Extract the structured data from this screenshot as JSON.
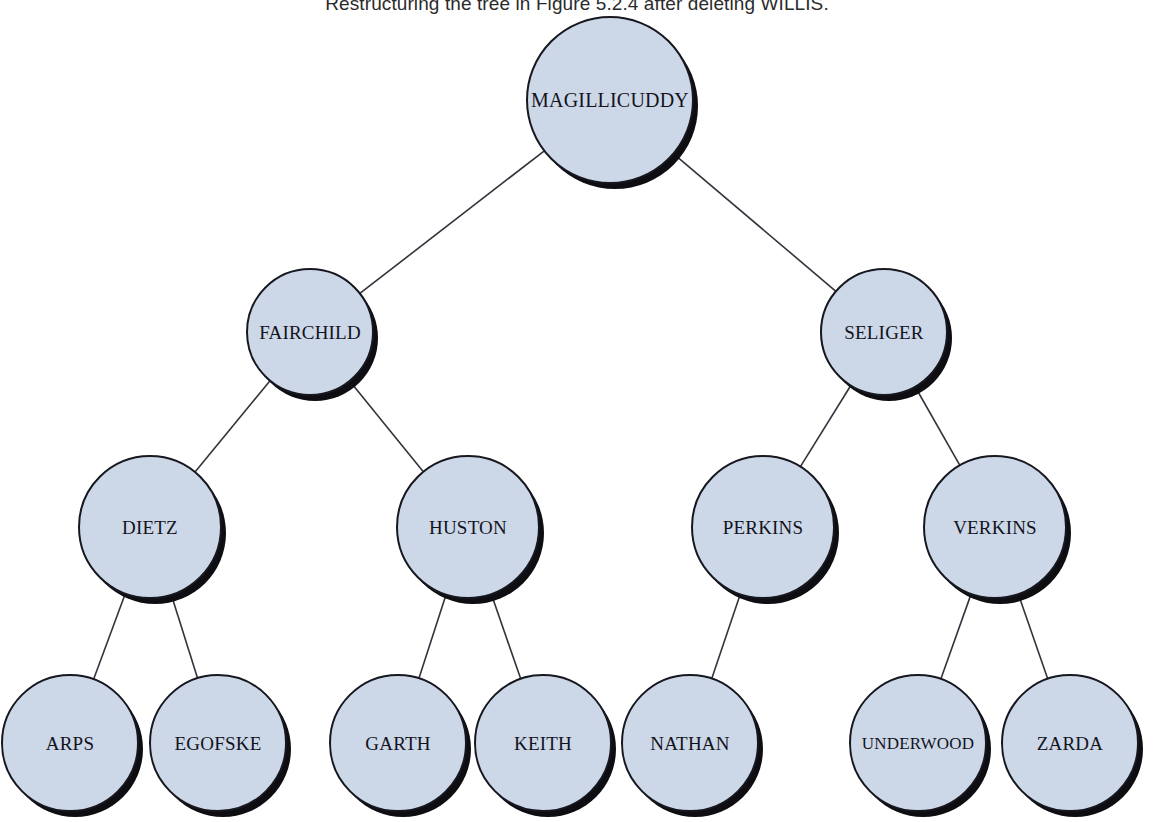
{
  "figure": {
    "caption": "Restructuring the tree in Figure 5.2.4 after deleting WILLIS.",
    "background_color": "#ffffff",
    "node_fill_color": "#ccd8e8",
    "node_border_color": "#17171f",
    "node_shadow_color": "#0d0d12",
    "edge_color": "#33333d",
    "text_color": "#13131c"
  },
  "tree": {
    "type": "binary-search-tree",
    "levels": 4,
    "node_count": 15,
    "nodes": [
      {
        "id": "magillicuddy",
        "label": "MAGILLICUDDY",
        "cx": 610,
        "cy": 100,
        "r": 84,
        "font_size": 20,
        "level": 0,
        "parent": null
      },
      {
        "id": "fairchild",
        "label": "FAIRCHILD",
        "cx": 310,
        "cy": 332,
        "r": 64,
        "font_size": 19,
        "level": 1,
        "parent": "magillicuddy"
      },
      {
        "id": "seliger",
        "label": "SELIGER",
        "cx": 884,
        "cy": 332,
        "r": 64,
        "font_size": 19,
        "level": 1,
        "parent": "magillicuddy"
      },
      {
        "id": "dietz",
        "label": "DIETZ",
        "cx": 150,
        "cy": 527,
        "r": 72,
        "font_size": 19,
        "level": 2,
        "parent": "fairchild"
      },
      {
        "id": "huston",
        "label": "HUSTON",
        "cx": 468,
        "cy": 527,
        "r": 72,
        "font_size": 19,
        "level": 2,
        "parent": "fairchild"
      },
      {
        "id": "perkins",
        "label": "PERKINS",
        "cx": 763,
        "cy": 527,
        "r": 72,
        "font_size": 19,
        "level": 2,
        "parent": "seliger"
      },
      {
        "id": "verkins",
        "label": "VERKINS",
        "cx": 995,
        "cy": 527,
        "r": 72,
        "font_size": 19,
        "level": 2,
        "parent": "seliger"
      },
      {
        "id": "arps",
        "label": "ARPS",
        "cx": 70,
        "cy": 743,
        "r": 69,
        "font_size": 19,
        "level": 3,
        "parent": "dietz"
      },
      {
        "id": "egofske",
        "label": "EGOFSKE",
        "cx": 218,
        "cy": 743,
        "r": 69,
        "font_size": 19,
        "level": 3,
        "parent": "dietz"
      },
      {
        "id": "garth",
        "label": "GARTH",
        "cx": 398,
        "cy": 743,
        "r": 69,
        "font_size": 19,
        "level": 3,
        "parent": "huston"
      },
      {
        "id": "keith",
        "label": "KEITH",
        "cx": 543,
        "cy": 743,
        "r": 69,
        "font_size": 19,
        "level": 3,
        "parent": "huston"
      },
      {
        "id": "nathan",
        "label": "NATHAN",
        "cx": 690,
        "cy": 743,
        "r": 69,
        "font_size": 19,
        "level": 3,
        "parent": "perkins"
      },
      {
        "id": "underwood",
        "label": "UNDERWOOD",
        "cx": 918,
        "cy": 743,
        "r": 69,
        "font_size": 17,
        "level": 3,
        "parent": "verkins"
      },
      {
        "id": "zarda",
        "label": "ZARDA",
        "cx": 1070,
        "cy": 743,
        "r": 69,
        "font_size": 19,
        "level": 3,
        "parent": "verkins"
      }
    ],
    "edges": [
      {
        "from": "magillicuddy",
        "to": "fairchild"
      },
      {
        "from": "magillicuddy",
        "to": "seliger"
      },
      {
        "from": "fairchild",
        "to": "dietz"
      },
      {
        "from": "fairchild",
        "to": "huston"
      },
      {
        "from": "seliger",
        "to": "perkins"
      },
      {
        "from": "seliger",
        "to": "verkins"
      },
      {
        "from": "dietz",
        "to": "arps"
      },
      {
        "from": "dietz",
        "to": "egofske"
      },
      {
        "from": "huston",
        "to": "garth"
      },
      {
        "from": "huston",
        "to": "keith"
      },
      {
        "from": "perkins",
        "to": "nathan"
      },
      {
        "from": "verkins",
        "to": "underwood"
      },
      {
        "from": "verkins",
        "to": "zarda"
      }
    ]
  }
}
